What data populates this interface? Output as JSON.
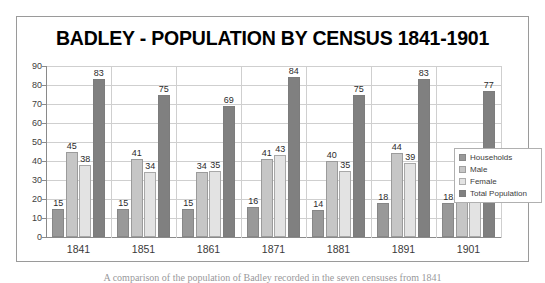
{
  "chart_data": {
    "type": "bar",
    "title": "BADLEY - POPULATION BY CENSUS 1841-1901",
    "xlabel": "",
    "ylabel": "",
    "ylim": [
      0,
      90
    ],
    "ytick_step": 10,
    "yticks": [
      "0",
      "10",
      "20",
      "30",
      "40",
      "50",
      "60",
      "70",
      "80",
      "90"
    ],
    "grid": true,
    "legend_position": "right",
    "categories": [
      "1841",
      "1851",
      "1861",
      "1871",
      "1881",
      "1891",
      "1901"
    ],
    "series": [
      {
        "name": "Households",
        "color": "#999999",
        "values": [
          15,
          15,
          15,
          16,
          14,
          18,
          18
        ]
      },
      {
        "name": "Male",
        "color": "#c6c6c6",
        "values": [
          45,
          41,
          34,
          41,
          40,
          44,
          42
        ]
      },
      {
        "name": "Female",
        "color": "#e3e3e3",
        "values": [
          38,
          34,
          35,
          43,
          35,
          39,
          35
        ]
      },
      {
        "name": "Total Population",
        "color": "#808080",
        "values": [
          83,
          75,
          69,
          84,
          75,
          83,
          77
        ]
      }
    ],
    "data_labels": true
  },
  "caption": {
    "text": "A comparison of the population of Badley recorded in the seven censuses from 1841"
  },
  "colors": {
    "frame_border": "#9a9a9a",
    "gridline": "#cfcfcf",
    "axis": "#8a8a8a",
    "title_text": "#000000",
    "tick_text": "#404040"
  }
}
